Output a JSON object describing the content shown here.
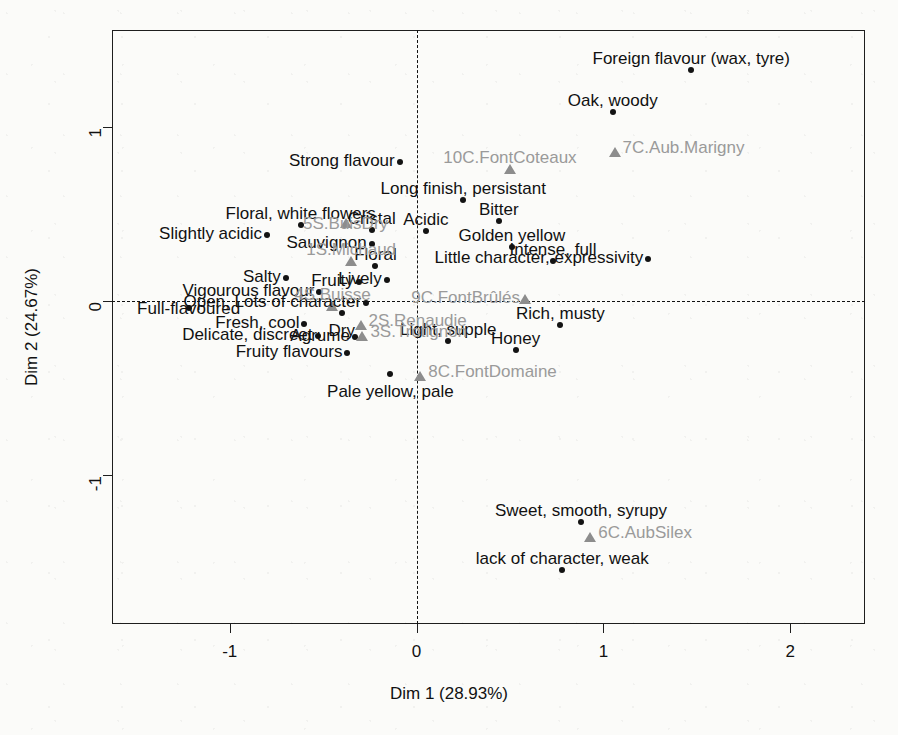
{
  "chart_data": {
    "type": "scatter",
    "title": "",
    "xlabel": "Dim 1 (28.93%)",
    "ylabel": "Dim 2 (24.67%)",
    "xlim": [
      -1.63,
      2.4
    ],
    "ylim": [
      -1.86,
      1.56
    ],
    "xticks": [
      -1,
      0,
      1,
      2
    ],
    "xticklabels": [
      "-1",
      "0",
      "1",
      "2"
    ],
    "yticks": [
      1,
      0,
      -1
    ],
    "yticklabels": [
      "1",
      "0",
      "-1"
    ],
    "grid": false,
    "legend": null,
    "reference_lines": {
      "vertical_at_x": 0,
      "horizontal_at_y": 0,
      "style": "dashed"
    },
    "series": [
      {
        "name": "variables",
        "marker": "filled-circle",
        "color": "#131313",
        "label_color": "#111111",
        "points": [
          {
            "label": "Foreign flavour (wax, tyre)",
            "x": 1.47,
            "y": 1.33,
            "label_pos": "above-center"
          },
          {
            "label": "Oak, woody",
            "x": 1.05,
            "y": 1.09,
            "label_pos": "above-center"
          },
          {
            "label": "Strong flavour",
            "x": -0.09,
            "y": 0.8,
            "label_pos": "left"
          },
          {
            "label": "Long finish, persistant",
            "x": 0.25,
            "y": 0.58,
            "label_pos": "above-center"
          },
          {
            "label": "Bitter",
            "x": 0.44,
            "y": 0.46,
            "label_pos": "above-center"
          },
          {
            "label": "Floral, white flowers",
            "x": -0.62,
            "y": 0.44,
            "label_pos": "above-center"
          },
          {
            "label": "Acidic",
            "x": 0.05,
            "y": 0.4,
            "label_pos": "above-center"
          },
          {
            "label": "Slightly acidic",
            "x": -0.8,
            "y": 0.38,
            "label_pos": "left"
          },
          {
            "label": "Golden yellow",
            "x": 0.51,
            "y": 0.31,
            "label_pos": "above-center"
          },
          {
            "label": "Sauvignon",
            "x": -0.24,
            "y": 0.33,
            "label_pos": "left"
          },
          {
            "label": "Intense, full",
            "x": 0.73,
            "y": 0.23,
            "label_pos": "above-center"
          },
          {
            "label": "Little character, expressivity",
            "x": 1.24,
            "y": 0.24,
            "label_pos": "left"
          },
          {
            "label": "Floral",
            "x": -0.22,
            "y": 0.2,
            "label_pos": "above-center"
          },
          {
            "label": "Salty",
            "x": -0.7,
            "y": 0.13,
            "label_pos": "left"
          },
          {
            "label": "Fruity",
            "x": -0.31,
            "y": 0.11,
            "label_pos": "left"
          },
          {
            "label": "Lively",
            "x": -0.16,
            "y": 0.12,
            "label_pos": "left"
          },
          {
            "label": "Vigourous flavour",
            "x": -0.52,
            "y": 0.05,
            "label_pos": "left"
          },
          {
            "label": "Open, Lots of character",
            "x": -0.27,
            "y": -0.01,
            "label_pos": "left"
          },
          {
            "label": "Rich, musty",
            "x": 0.77,
            "y": -0.14,
            "label_pos": "above-center"
          },
          {
            "label": "Full-flavoured",
            "x": -1.22,
            "y": -0.04,
            "label_pos": "center"
          },
          {
            "label": "Dry",
            "x": -0.4,
            "y": -0.07,
            "label_pos": "below-center"
          },
          {
            "label": "Fresh, cool",
            "x": -0.6,
            "y": -0.13,
            "label_pos": "left"
          },
          {
            "label": "Light, supple",
            "x": 0.17,
            "y": -0.23,
            "label_pos": "above-center"
          },
          {
            "label": "Honey",
            "x": 0.53,
            "y": -0.28,
            "label_pos": "above-center"
          },
          {
            "label": "Delicate, discreet",
            "x": -0.53,
            "y": -0.2,
            "label_pos": "left"
          },
          {
            "label": "Agrume",
            "x": -0.33,
            "y": -0.21,
            "label_pos": "left"
          },
          {
            "label": "Fruity flavours",
            "x": -0.37,
            "y": -0.3,
            "label_pos": "left"
          },
          {
            "label": "Cristal",
            "x": -0.24,
            "y": 0.41,
            "label_pos": "above-center"
          },
          {
            "label": "Pale yellow, pale",
            "x": -0.14,
            "y": -0.42,
            "label_pos": "below-center"
          },
          {
            "label": "Sweet, smooth, syrupy",
            "x": 0.88,
            "y": -1.27,
            "label_pos": "above-center"
          },
          {
            "label": "lack of character, weak",
            "x": 0.78,
            "y": -1.55,
            "label_pos": "above-center"
          }
        ]
      },
      {
        "name": "individuals",
        "marker": "filled-triangle",
        "color": "#8d8d8d",
        "label_color": "#9a9a9a",
        "points": [
          {
            "label": "7C.Aub.Marigny",
            "x": 1.06,
            "y": 0.86,
            "label_pos": "right"
          },
          {
            "label": "10C.FontCoteaux",
            "x": 0.5,
            "y": 0.76,
            "label_pos": "above-center"
          },
          {
            "label": "5S.BuisDry",
            "x": -0.38,
            "y": 0.45,
            "label_pos": "center"
          },
          {
            "label": "1S.Michaud",
            "x": -0.35,
            "y": 0.23,
            "label_pos": "above-center"
          },
          {
            "label": "9C.FontBrûlés",
            "x": 0.58,
            "y": 0.01,
            "label_pos": "left"
          },
          {
            "label": "4S.Buisse",
            "x": -0.45,
            "y": -0.03,
            "label_pos": "above-center"
          },
          {
            "label": "2S.Renaudie",
            "x": -0.3,
            "y": -0.14,
            "label_pos": "right"
          },
          {
            "label": "3S.Trotignon",
            "x": -0.29,
            "y": -0.2,
            "label_pos": "right"
          },
          {
            "label": "8C.FontDomaine",
            "x": 0.02,
            "y": -0.43,
            "label_pos": "right"
          },
          {
            "label": "6C.AubSilex",
            "x": 0.93,
            "y": -1.36,
            "label_pos": "right"
          }
        ]
      }
    ]
  }
}
